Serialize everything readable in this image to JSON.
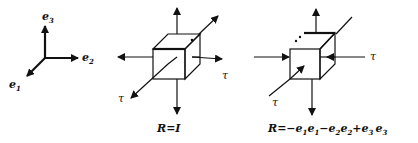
{
  "axes": {
    "e1": {
      "base": "e",
      "sub": "1"
    },
    "e2": {
      "base": "e",
      "sub": "2"
    },
    "e3": {
      "base": "e",
      "sub": "3"
    }
  },
  "panel_identity": {
    "tau_right": "τ",
    "tau_left": "τ",
    "caption": "R=I"
  },
  "panel_rotation": {
    "tau_right": "τ",
    "tau_left": "τ",
    "caption_R": "R",
    "caption_eq": "=−",
    "terms": [
      {
        "a": "e",
        "as": "1",
        "b": "e",
        "bs": "1",
        "op": "−"
      },
      {
        "a": "e",
        "as": "2",
        "b": "e",
        "bs": "2",
        "op": "+"
      },
      {
        "a": "e",
        "as": "3",
        "b": "e",
        "bs": "3",
        "op": ""
      }
    ]
  },
  "colors": {
    "ink": "#111111",
    "background": "#ffffff"
  }
}
